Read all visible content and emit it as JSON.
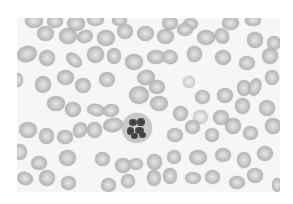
{
  "image": {
    "description": "Grayscale blood smear micrograph: red blood cells surrounding a single segmented neutrophil",
    "background_color": "#f6f6f6",
    "cell_color": "#b9b9b9",
    "nucleus_color": "#3a3a3a"
  },
  "neutrophil": {
    "x": 105,
    "y": 95,
    "w": 30,
    "h": 30,
    "lobes": [
      {
        "x": 7,
        "y": 6,
        "w": 8,
        "h": 7
      },
      {
        "x": 15,
        "y": 5,
        "w": 8,
        "h": 8
      },
      {
        "x": 5,
        "y": 14,
        "w": 7,
        "h": 8
      },
      {
        "x": 13,
        "y": 14,
        "w": 9,
        "h": 7
      },
      {
        "x": 17,
        "y": 19,
        "w": 7,
        "h": 6
      },
      {
        "x": 9,
        "y": 20,
        "w": 7,
        "h": 6
      }
    ]
  },
  "cells": [
    {
      "x": 8,
      "y": -4,
      "w": 18,
      "h": 14,
      "r": 0
    },
    {
      "x": 30,
      "y": -3,
      "w": 16,
      "h": 13,
      "r": 0
    },
    {
      "x": 50,
      "y": -2,
      "w": 18,
      "h": 15,
      "r": 0
    },
    {
      "x": 70,
      "y": -4,
      "w": 17,
      "h": 12,
      "r": 0
    },
    {
      "x": 95,
      "y": -3,
      "w": 15,
      "h": 11,
      "r": 0
    },
    {
      "x": 145,
      "y": -2,
      "w": 16,
      "h": 14,
      "r": 0
    },
    {
      "x": 166,
      "y": 0,
      "w": 15,
      "h": 12,
      "r": 0
    },
    {
      "x": 205,
      "y": -2,
      "w": 17,
      "h": 14,
      "r": 0
    },
    {
      "x": 228,
      "y": -3,
      "w": 16,
      "h": 11,
      "r": 0
    },
    {
      "x": 20,
      "y": 8,
      "w": 17,
      "h": 15,
      "r": 0
    },
    {
      "x": 42,
      "y": 10,
      "w": 18,
      "h": 16,
      "r": 0
    },
    {
      "x": 60,
      "y": 12,
      "w": 16,
      "h": 13,
      "r": -20
    },
    {
      "x": 80,
      "y": 12,
      "w": 18,
      "h": 16,
      "r": 0
    },
    {
      "x": 100,
      "y": 6,
      "w": 16,
      "h": 15,
      "r": 0
    },
    {
      "x": 120,
      "y": 8,
      "w": 17,
      "h": 15,
      "r": 0
    },
    {
      "x": 140,
      "y": 11,
      "w": 17,
      "h": 15,
      "r": 0
    },
    {
      "x": 160,
      "y": 5,
      "w": 16,
      "h": 13,
      "r": 0
    },
    {
      "x": 180,
      "y": 12,
      "w": 18,
      "h": 15,
      "r": 0
    },
    {
      "x": 198,
      "y": 10,
      "w": 14,
      "h": 16,
      "r": -30
    },
    {
      "x": 230,
      "y": 14,
      "w": 16,
      "h": 16,
      "r": 0
    },
    {
      "x": 250,
      "y": 18,
      "w": 14,
      "h": 14,
      "r": 0
    },
    {
      "x": 0,
      "y": 28,
      "w": 20,
      "h": 16,
      "r": -20
    },
    {
      "x": 22,
      "y": 32,
      "w": 16,
      "h": 16,
      "r": 0
    },
    {
      "x": 48,
      "y": 36,
      "w": 18,
      "h": 12,
      "r": 40
    },
    {
      "x": 70,
      "y": 28,
      "w": 17,
      "h": 17,
      "r": 0
    },
    {
      "x": 90,
      "y": 30,
      "w": 14,
      "h": 16,
      "r": 0
    },
    {
      "x": 108,
      "y": 36,
      "w": 18,
      "h": 16,
      "r": 0
    },
    {
      "x": 130,
      "y": 32,
      "w": 18,
      "h": 14,
      "r": 0
    },
    {
      "x": 145,
      "y": 32,
      "w": 16,
      "h": 14,
      "r": 20
    },
    {
      "x": 170,
      "y": 28,
      "w": 15,
      "h": 16,
      "r": 0
    },
    {
      "x": 198,
      "y": 32,
      "w": 16,
      "h": 15,
      "r": 0
    },
    {
      "x": 222,
      "y": 38,
      "w": 16,
      "h": 14,
      "r": 0
    },
    {
      "x": 245,
      "y": 30,
      "w": 16,
      "h": 16,
      "r": 0
    },
    {
      "x": -4,
      "y": 55,
      "w": 10,
      "h": 14,
      "r": 0
    },
    {
      "x": 18,
      "y": 58,
      "w": 16,
      "h": 17,
      "r": 0
    },
    {
      "x": 40,
      "y": 52,
      "w": 17,
      "h": 15,
      "r": 0
    },
    {
      "x": 58,
      "y": 60,
      "w": 16,
      "h": 15,
      "r": 0
    },
    {
      "x": 82,
      "y": 54,
      "w": 16,
      "h": 15,
      "r": 0
    },
    {
      "x": 120,
      "y": 52,
      "w": 18,
      "h": 15,
      "r": -15
    },
    {
      "x": 132,
      "y": 62,
      "w": 16,
      "h": 14,
      "r": 0
    },
    {
      "x": 112,
      "y": 68,
      "w": 20,
      "h": 18,
      "r": 0
    },
    {
      "x": 133,
      "y": 78,
      "w": 18,
      "h": 15,
      "r": 0
    },
    {
      "x": 166,
      "y": 58,
      "w": 12,
      "h": 12,
      "r": 0,
      "p": 1
    },
    {
      "x": 178,
      "y": 72,
      "w": 15,
      "h": 14,
      "r": 0
    },
    {
      "x": 200,
      "y": 70,
      "w": 16,
      "h": 15,
      "r": 0
    },
    {
      "x": 220,
      "y": 62,
      "w": 14,
      "h": 16,
      "r": 0
    },
    {
      "x": 232,
      "y": 60,
      "w": 12,
      "h": 18,
      "r": 20
    },
    {
      "x": 248,
      "y": 52,
      "w": 14,
      "h": 15,
      "r": 0
    },
    {
      "x": 30,
      "y": 78,
      "w": 18,
      "h": 15,
      "r": 0
    },
    {
      "x": 48,
      "y": 84,
      "w": 16,
      "h": 15,
      "r": 0
    },
    {
      "x": 70,
      "y": 86,
      "w": 18,
      "h": 12,
      "r": 10
    },
    {
      "x": 86,
      "y": 86,
      "w": 16,
      "h": 13,
      "r": -10
    },
    {
      "x": 156,
      "y": 88,
      "w": 15,
      "h": 15,
      "r": 0
    },
    {
      "x": 176,
      "y": 92,
      "w": 15,
      "h": 14,
      "r": 0,
      "p": 1
    },
    {
      "x": 196,
      "y": 92,
      "w": 16,
      "h": 15,
      "r": 0
    },
    {
      "x": 218,
      "y": 80,
      "w": 15,
      "h": 16,
      "r": 0
    },
    {
      "x": 242,
      "y": 82,
      "w": 16,
      "h": 16,
      "r": 0
    },
    {
      "x": 2,
      "y": 104,
      "w": 18,
      "h": 16,
      "r": 0
    },
    {
      "x": 22,
      "y": 110,
      "w": 15,
      "h": 16,
      "r": 0
    },
    {
      "x": 40,
      "y": 112,
      "w": 16,
      "h": 14,
      "r": 0
    },
    {
      "x": 56,
      "y": 104,
      "w": 14,
      "h": 16,
      "r": 30
    },
    {
      "x": 70,
      "y": 104,
      "w": 15,
      "h": 16,
      "r": 0
    },
    {
      "x": 86,
      "y": 100,
      "w": 20,
      "h": 14,
      "r": -10
    },
    {
      "x": 150,
      "y": 110,
      "w": 16,
      "h": 14,
      "r": 0
    },
    {
      "x": 168,
      "y": 102,
      "w": 15,
      "h": 14,
      "r": 0
    },
    {
      "x": 188,
      "y": 110,
      "w": 14,
      "h": 14,
      "r": 0
    },
    {
      "x": 208,
      "y": 100,
      "w": 16,
      "h": 16,
      "r": 0
    },
    {
      "x": 226,
      "y": 108,
      "w": 15,
      "h": 14,
      "r": 0
    },
    {
      "x": 248,
      "y": 100,
      "w": 16,
      "h": 16,
      "r": 0
    },
    {
      "x": -4,
      "y": 126,
      "w": 14,
      "h": 16,
      "r": 0
    },
    {
      "x": 14,
      "y": 138,
      "w": 16,
      "h": 14,
      "r": 0
    },
    {
      "x": 42,
      "y": 132,
      "w": 17,
      "h": 16,
      "r": 0
    },
    {
      "x": 78,
      "y": 134,
      "w": 15,
      "h": 14,
      "r": 0
    },
    {
      "x": 98,
      "y": 140,
      "w": 16,
      "h": 15,
      "r": 0
    },
    {
      "x": 112,
      "y": 140,
      "w": 14,
      "h": 12,
      "r": 0
    },
    {
      "x": 130,
      "y": 136,
      "w": 15,
      "h": 16,
      "r": 0
    },
    {
      "x": 150,
      "y": 132,
      "w": 14,
      "h": 14,
      "r": 0
    },
    {
      "x": 172,
      "y": 132,
      "w": 18,
      "h": 15,
      "r": 0
    },
    {
      "x": 198,
      "y": 130,
      "w": 16,
      "h": 14,
      "r": 0
    },
    {
      "x": 220,
      "y": 134,
      "w": 14,
      "h": 16,
      "r": 0
    },
    {
      "x": 240,
      "y": 128,
      "w": 16,
      "h": 15,
      "r": 0
    },
    {
      "x": 0,
      "y": 154,
      "w": 16,
      "h": 13,
      "r": 20
    },
    {
      "x": 22,
      "y": 152,
      "w": 16,
      "h": 16,
      "r": 0
    },
    {
      "x": 44,
      "y": 158,
      "w": 15,
      "h": 14,
      "r": 0
    },
    {
      "x": 84,
      "y": 160,
      "w": 15,
      "h": 14,
      "r": 0
    },
    {
      "x": 104,
      "y": 156,
      "w": 14,
      "h": 14,
      "r": 0
    },
    {
      "x": 130,
      "y": 152,
      "w": 14,
      "h": 16,
      "r": 0
    },
    {
      "x": 146,
      "y": 150,
      "w": 14,
      "h": 16,
      "r": 0
    },
    {
      "x": 168,
      "y": 154,
      "w": 16,
      "h": 12,
      "r": 0
    },
    {
      "x": 188,
      "y": 152,
      "w": 15,
      "h": 14,
      "r": 0
    },
    {
      "x": 212,
      "y": 158,
      "w": 16,
      "h": 13,
      "r": 0
    },
    {
      "x": 230,
      "y": 150,
      "w": 16,
      "h": 15,
      "r": 0
    },
    {
      "x": 255,
      "y": 160,
      "w": 10,
      "h": 14,
      "r": 0
    }
  ]
}
